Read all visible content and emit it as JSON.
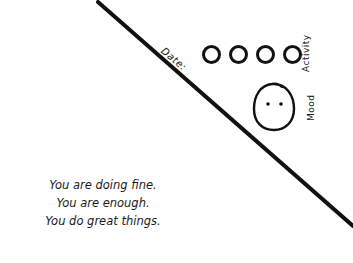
{
  "card": {
    "date_label": "Date:",
    "activity": {
      "label": "Activity",
      "circles": [
        {
          "id": 1,
          "filled": false
        },
        {
          "id": 2,
          "filled": false
        },
        {
          "id": 3,
          "filled": false
        },
        {
          "id": 4,
          "filled": false
        }
      ]
    },
    "mood": {
      "label": "Mood",
      "icon": "neutral-face-icon"
    },
    "message_lines": [
      "You are doing fine.",
      "You are enough.",
      "You do great things."
    ]
  },
  "colors": {
    "background": "#ffffff",
    "ink": "#111111"
  }
}
